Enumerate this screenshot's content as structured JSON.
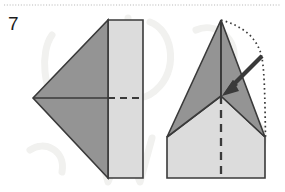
{
  "page": {
    "width": 285,
    "height": 192,
    "background": "#ffffff",
    "type": "origami-instruction-step"
  },
  "step": {
    "number": "7",
    "label_x": 8,
    "label_y": 14
  },
  "top_rule": {
    "name": "dotted-separator-line",
    "style": "dotted",
    "color": "#b9b9b9",
    "y": 5
  },
  "watermark": {
    "name": "background-watermark",
    "color": "#f0f0ee",
    "description": "faint light-gray letterforms behind the diagrams"
  },
  "colors": {
    "stroke": "#3a3a3a",
    "dark_face": "#949494",
    "light_face": "#dcdcdc",
    "mid_face": "#b0b0b0",
    "dotted_guide": "#3a3a3a",
    "arrow": "#3a3a3a",
    "paper_white": "#f2f2f0"
  },
  "figures": {
    "left": {
      "name": "folded-paper-before",
      "caption": "",
      "shapes": {
        "dark_triangle": {
          "name": "dark-triangle-face",
          "points": "33,98 108,20 108,178",
          "fill": "#949494"
        },
        "light_rectangle": {
          "name": "light-rectangle-face",
          "points": "108,20 143,20 143,178 108,178",
          "fill": "#dcdcdc"
        },
        "center_line_solid": {
          "name": "center-crease-solid",
          "from": "33,98",
          "to": "108,98"
        },
        "center_line_dashed": {
          "name": "center-crease-dashed",
          "from": "108,98",
          "to": "143,98"
        }
      }
    },
    "right": {
      "name": "folded-paper-after",
      "caption": "",
      "shapes": {
        "left_wing_dark": {
          "name": "left-wing-dark-face",
          "points": "221,20 221,96 167,137",
          "fill": "#949494"
        },
        "right_wing_dark": {
          "name": "right-wing-dark-face",
          "points": "221,20 265,137 221,96",
          "fill": "#949494"
        },
        "body_light": {
          "name": "body-light-face",
          "points": "167,137 221,96 265,137 265,178 167,178",
          "fill": "#dcdcdc"
        },
        "center_line_dashed": {
          "name": "center-crease-dashed",
          "from": "221,96",
          "to": "221,178"
        },
        "dotted_guide": {
          "name": "dotted-fold-guide",
          "description": "dotted curve from apex arcing right then down to the right wing tip",
          "path": "221,20 -> 256,52 -> 264,96 -> 265,137"
        }
      }
    }
  },
  "arrow": {
    "name": "fold-direction-arrow",
    "from_x": 262,
    "from_y": 56,
    "to_x": 222,
    "to_y": 96,
    "color": "#3a3a3a",
    "head": "solid-filled"
  }
}
